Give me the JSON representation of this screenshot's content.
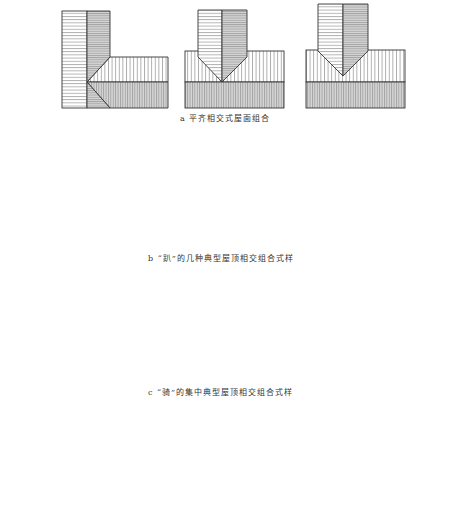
{
  "rows": [
    {
      "id": "a",
      "caption": "a 平齐相交式屋面组合",
      "figure_count": 3
    },
    {
      "id": "b",
      "caption": "b “趴”的几种典型屋顶相交组合式样",
      "figure_count": 3
    },
    {
      "id": "c",
      "caption": "c “骑”的集中典型屋顶相交组合式样",
      "figure_count": 4
    },
    {
      "id": "d",
      "caption": "",
      "figure_count": 4
    }
  ],
  "colors": {
    "line": "#333333",
    "light_fill": "#ffffff",
    "shaded_fill": "#d6d6d6",
    "background": "#ffffff"
  },
  "legend": {
    "horizontal_hatch": "roof slope (horizontal hatch)",
    "vertical_hatch": "roof slope (vertical hatch)",
    "shaded": "shaded slope"
  }
}
